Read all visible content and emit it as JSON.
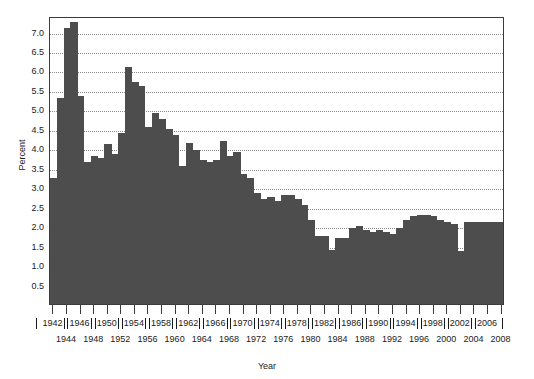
{
  "chart_data": {
    "type": "bar",
    "title": "",
    "xlabel": "Year",
    "ylabel": "Percent",
    "ylim": [
      0,
      7.4
    ],
    "xlim": [
      1942,
      2008
    ],
    "grid": true,
    "legend": "none",
    "bar_color": "#4d4d4d",
    "y_ticks": [
      "0.5",
      "1.0",
      "1.5",
      "2.0",
      "2.5",
      "3.0",
      "3.5",
      "4.0",
      "4.5",
      "5.0",
      "5.5",
      "6.0",
      "6.5",
      "7.0"
    ],
    "y_tick_values": [
      0.5,
      1.0,
      1.5,
      2.0,
      2.5,
      3.0,
      3.5,
      4.0,
      4.5,
      5.0,
      5.5,
      6.0,
      6.5,
      7.0
    ],
    "x_tick_labels_upper": [
      "1942",
      "1946",
      "1950",
      "1954",
      "1958",
      "1962",
      "1966",
      "1970",
      "1974",
      "1978",
      "1982",
      "1986",
      "1990",
      "1994",
      "1998",
      "2002",
      "2006"
    ],
    "x_tick_labels_lower": [
      "1944",
      "1948",
      "1952",
      "1956",
      "1960",
      "1964",
      "1968",
      "1972",
      "1976",
      "1980",
      "1984",
      "1988",
      "1992",
      "1996",
      "2000",
      "2004",
      "2008"
    ],
    "categories": [
      "1942",
      "1943",
      "1944",
      "1945",
      "1946",
      "1947",
      "1948",
      "1949",
      "1950",
      "1951",
      "1952",
      "1953",
      "1954",
      "1955",
      "1956",
      "1957",
      "1958",
      "1959",
      "1960",
      "1961",
      "1962",
      "1963",
      "1964",
      "1965",
      "1966",
      "1967",
      "1968",
      "1969",
      "1970",
      "1971",
      "1972",
      "1973",
      "1974",
      "1975",
      "1976",
      "1977",
      "1978",
      "1979",
      "1980",
      "1981",
      "1982",
      "1983",
      "1984",
      "1985",
      "1986",
      "1987",
      "1988",
      "1989",
      "1990",
      "1991",
      "1992",
      "1993",
      "1994",
      "1995",
      "1996",
      "1997",
      "1998",
      "1999",
      "2000",
      "2001",
      "2002",
      "2003",
      "2004",
      "2005",
      "2006",
      "2007",
      "2008"
    ],
    "values": [
      3.25,
      5.3,
      7.1,
      7.25,
      5.35,
      3.65,
      3.8,
      3.75,
      4.1,
      3.85,
      4.4,
      6.1,
      5.7,
      5.6,
      4.55,
      4.9,
      4.75,
      4.5,
      4.35,
      3.55,
      4.15,
      3.95,
      3.7,
      3.65,
      3.7,
      4.2,
      3.8,
      3.9,
      3.35,
      3.25,
      2.85,
      2.7,
      2.75,
      2.65,
      2.8,
      2.8,
      2.7,
      2.55,
      2.15,
      1.75,
      1.75,
      1.4,
      1.7,
      1.7,
      1.95,
      2.0,
      1.9,
      1.85,
      1.9,
      1.85,
      1.8,
      1.95,
      2.15,
      2.25,
      2.3,
      2.3,
      2.25,
      2.15,
      2.1,
      2.05,
      1.35,
      2.1,
      2.1,
      2.1,
      2.1,
      2.1,
      2.1
    ]
  }
}
